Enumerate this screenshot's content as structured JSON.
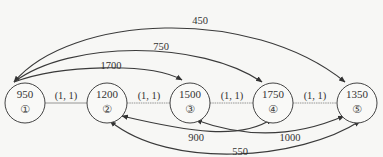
{
  "diagram": {
    "type": "network",
    "nodes": [
      {
        "id": "1",
        "symbol": "①",
        "value": "950",
        "cx": 25,
        "cy": 100
      },
      {
        "id": "2",
        "symbol": "②",
        "value": "1200",
        "cx": 107,
        "cy": 100
      },
      {
        "id": "3",
        "symbol": "③",
        "value": "1500",
        "cx": 190,
        "cy": 100
      },
      {
        "id": "4",
        "symbol": "④",
        "value": "1750",
        "cx": 273,
        "cy": 100
      },
      {
        "id": "5",
        "symbol": "⑤",
        "value": "1350",
        "cx": 357,
        "cy": 100
      }
    ],
    "straight_edges": [
      {
        "from": "1",
        "to": "2",
        "label": "(1, 1)"
      },
      {
        "from": "2",
        "to": "3",
        "label": "(1, 1)"
      },
      {
        "from": "3",
        "to": "4",
        "label": "(1, 1)"
      },
      {
        "from": "4",
        "to": "5",
        "label": "(1, 1)"
      }
    ],
    "top_arcs": [
      {
        "from": "1",
        "to": "5",
        "label": "450"
      },
      {
        "from": "1",
        "to": "4",
        "label": "750"
      },
      {
        "from": "1",
        "to": "3",
        "label": "1700"
      }
    ],
    "bottom_arcs": [
      {
        "from": "4",
        "to": "2",
        "label": "900"
      },
      {
        "from": "3",
        "to": "5",
        "label": "1000"
      },
      {
        "from": "2",
        "to": "5",
        "label": "550"
      }
    ],
    "colors": {
      "line": "#3a3a3a",
      "edge_dotted": "#8a8a8a",
      "text": "#333333"
    }
  }
}
